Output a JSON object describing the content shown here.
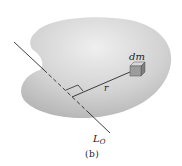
{
  "figure": {
    "caption": "(b)",
    "labels": {
      "mass_element": "dm",
      "radius": "r",
      "axis_main": "L",
      "axis_sub": "O"
    },
    "colors": {
      "body_fill_light": "#ebebeb",
      "body_fill_dark": "#b8b8b8",
      "line": "#2a2a2a",
      "cube_front": "#9a9a9a",
      "cube_top": "#d4d4d4",
      "cube_side": "#7e7e7e"
    }
  }
}
